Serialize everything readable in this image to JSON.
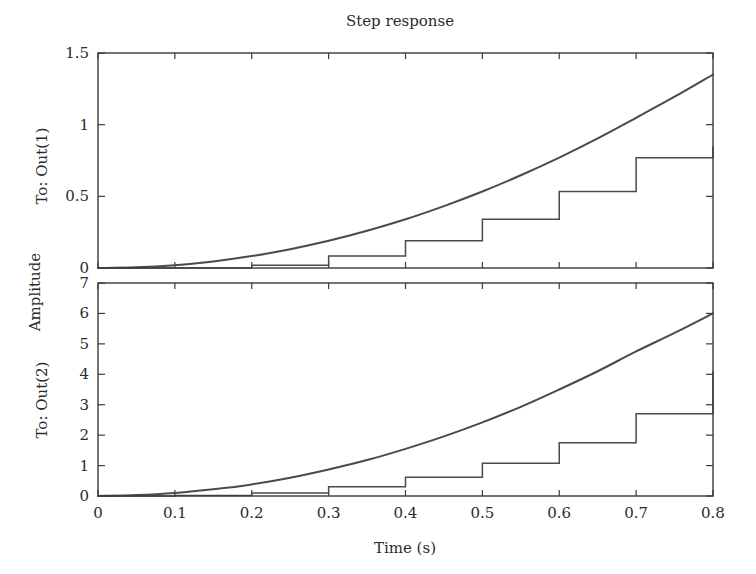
{
  "figure": {
    "title": "Step response",
    "xlabel": "Time (s)",
    "ylabel": "Amplitude",
    "row_labels": [
      "To: Out(1)",
      "To: Out(2)"
    ],
    "line_color": "#4a4a4a",
    "axis_color": "#3a3a3a",
    "background": "#ffffff"
  },
  "chart_data": [
    {
      "type": "line",
      "subplot": "To: Out(1)",
      "title": "Step response",
      "xlabel": "Time (s)",
      "ylabel": "Amplitude",
      "row_label": "To: Out(1)",
      "xlim": [
        0,
        0.8
      ],
      "ylim": [
        0,
        1.5
      ],
      "xticks": [
        0,
        0.1,
        0.2,
        0.3,
        0.4,
        0.5,
        0.6,
        0.7,
        0.8
      ],
      "xticklabels": [
        "0",
        "0.1",
        "0.2",
        "0.3",
        "0.4",
        "0.5",
        "0.6",
        "0.7",
        "0.8"
      ],
      "yticks": [
        0,
        0.5,
        1,
        1.5
      ],
      "yticklabels": [
        "0",
        "0.5",
        "1",
        "1.5"
      ],
      "grid": false,
      "legend": "none",
      "series": [
        {
          "name": "continuous",
          "style": "smooth-curve",
          "x": [
            0,
            0.05,
            0.1,
            0.15,
            0.2,
            0.25,
            0.3,
            0.35,
            0.4,
            0.45,
            0.5,
            0.55,
            0.6,
            0.65,
            0.7,
            0.75,
            0.8
          ],
          "y": [
            0,
            0.005,
            0.02,
            0.046,
            0.083,
            0.131,
            0.19,
            0.26,
            0.34,
            0.432,
            0.534,
            0.647,
            0.77,
            0.904,
            1.048,
            1.195,
            1.35
          ]
        },
        {
          "name": "discrete-hold",
          "style": "staircase",
          "x": [
            0,
            0.1,
            0.2,
            0.3,
            0.4,
            0.5,
            0.6,
            0.7,
            0.8
          ],
          "y": [
            0,
            0,
            0.02,
            0.083,
            0.19,
            0.34,
            0.534,
            0.77,
            0.85
          ]
        }
      ]
    },
    {
      "type": "line",
      "subplot": "To: Out(2)",
      "xlabel": "Time (s)",
      "ylabel": "Amplitude",
      "row_label": "To: Out(2)",
      "xlim": [
        0,
        0.8
      ],
      "ylim": [
        0,
        7
      ],
      "xticks": [
        0,
        0.1,
        0.2,
        0.3,
        0.4,
        0.5,
        0.6,
        0.7,
        0.8
      ],
      "xticklabels": [
        "0",
        "0.1",
        "0.2",
        "0.3",
        "0.4",
        "0.5",
        "0.6",
        "0.7",
        "0.8"
      ],
      "yticks": [
        0,
        1,
        2,
        3,
        4,
        5,
        6,
        7
      ],
      "yticklabels": [
        "0",
        "1",
        "2",
        "3",
        "4",
        "5",
        "6",
        "7"
      ],
      "grid": false,
      "legend": "none",
      "series": [
        {
          "name": "continuous",
          "style": "smooth-curve",
          "x": [
            0,
            0.05,
            0.1,
            0.15,
            0.2,
            0.25,
            0.3,
            0.35,
            0.4,
            0.45,
            0.5,
            0.55,
            0.6,
            0.65,
            0.7,
            0.75,
            0.8
          ],
          "y": [
            0,
            0.03,
            0.1,
            0.22,
            0.38,
            0.6,
            0.87,
            1.18,
            1.55,
            1.96,
            2.42,
            2.93,
            3.5,
            4.1,
            4.75,
            5.36,
            6.0
          ]
        },
        {
          "name": "discrete-hold",
          "style": "staircase",
          "x": [
            0,
            0.1,
            0.2,
            0.3,
            0.4,
            0.5,
            0.6,
            0.7,
            0.8
          ],
          "y": [
            0,
            0.02,
            0.1,
            0.3,
            0.62,
            1.08,
            1.75,
            2.7,
            4.1
          ]
        }
      ]
    }
  ]
}
